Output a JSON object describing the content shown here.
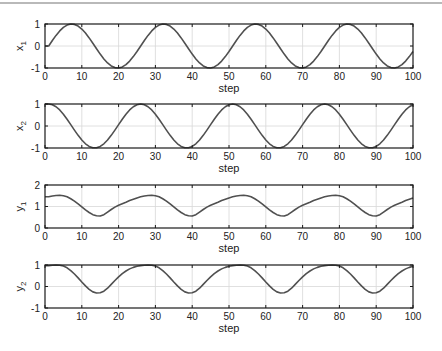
{
  "figure": {
    "width": 442,
    "height": 351,
    "line_color": "#505050",
    "grid_color": "#d8d8d8",
    "axes_color": "#1a1a1a"
  },
  "chart_data": [
    {
      "type": "line",
      "title": "",
      "xlabel": "step",
      "ylabel": "x_1",
      "ylabel_main": "x",
      "ylabel_sub": "1",
      "xlim": [
        0,
        100
      ],
      "ylim": [
        -1,
        1
      ],
      "xticks": [
        0,
        10,
        20,
        30,
        40,
        50,
        60,
        70,
        80,
        90,
        100
      ],
      "yticks": [
        -1,
        0,
        1
      ],
      "grid": true,
      "box": {
        "left": 45,
        "top": 24,
        "right": 413,
        "bottom": 68
      },
      "series": [
        {
          "name": "x1",
          "period_values": [
            0,
            0.249,
            0.482,
            0.685,
            0.844,
            0.951,
            0.998,
            0.982,
            0.905,
            0.771,
            0.588,
            0.368,
            0.125,
            -0.125,
            -0.368,
            -0.588,
            -0.771,
            -0.905,
            -0.982,
            -0.998,
            -0.951,
            -0.844,
            -0.685,
            -0.482,
            -0.249
          ]
        }
      ]
    },
    {
      "type": "line",
      "title": "",
      "xlabel": "step",
      "ylabel": "x_2",
      "ylabel_main": "x",
      "ylabel_sub": "2",
      "xlim": [
        0,
        100
      ],
      "ylim": [
        -1,
        1
      ],
      "xticks": [
        0,
        10,
        20,
        30,
        40,
        50,
        60,
        70,
        80,
        90,
        100
      ],
      "yticks": [
        -1,
        0,
        1
      ],
      "grid": true,
      "box": {
        "left": 45,
        "top": 104,
        "right": 413,
        "bottom": 148
      },
      "series": [
        {
          "name": "x2",
          "period_values": [
            1,
            0.969,
            0.876,
            0.729,
            0.536,
            0.309,
            0.063,
            -0.187,
            -0.426,
            -0.637,
            -0.809,
            -0.93,
            -0.992,
            -0.992,
            -0.93,
            -0.809,
            -0.637,
            -0.426,
            -0.187,
            0.063,
            0.309,
            0.536,
            0.729,
            0.876,
            0.969
          ]
        }
      ]
    },
    {
      "type": "line",
      "title": "",
      "xlabel": "step",
      "ylabel": "y_1",
      "ylabel_main": "y",
      "ylabel_sub": "1",
      "xlim": [
        0,
        100
      ],
      "ylim": [
        0,
        2
      ],
      "xticks": [
        0,
        10,
        20,
        30,
        40,
        50,
        60,
        70,
        80,
        90,
        100
      ],
      "yticks": [
        0,
        1,
        2
      ],
      "grid": true,
      "box": {
        "left": 45,
        "top": 185,
        "right": 413,
        "bottom": 228
      },
      "series": [
        {
          "name": "y1",
          "period_values": [
            1.45,
            1.49,
            1.51,
            1.52,
            1.5,
            1.45,
            1.36,
            1.25,
            1.12,
            0.98,
            0.84,
            0.72,
            0.62,
            0.57,
            0.56,
            0.62,
            0.74,
            0.86,
            0.97,
            1.06,
            1.13,
            1.2,
            1.28,
            1.34,
            1.4
          ]
        }
      ]
    },
    {
      "type": "line",
      "title": "",
      "xlabel": "step",
      "ylabel": "y_2",
      "ylabel_main": "y",
      "ylabel_sub": "2",
      "xlim": [
        0,
        100
      ],
      "ylim": [
        -1,
        1
      ],
      "xticks": [
        0,
        10,
        20,
        30,
        40,
        50,
        60,
        70,
        80,
        90,
        100
      ],
      "yticks": [
        -1,
        0,
        1
      ],
      "grid": true,
      "box": {
        "left": 45,
        "top": 265,
        "right": 413,
        "bottom": 308
      },
      "series": [
        {
          "name": "y2",
          "period_values": [
            0.97,
            0.99,
            1.0,
            0.99,
            0.95,
            0.87,
            0.74,
            0.58,
            0.4,
            0.21,
            0.03,
            -0.13,
            -0.25,
            -0.3,
            -0.29,
            -0.22,
            -0.08,
            0.1,
            0.28,
            0.45,
            0.6,
            0.72,
            0.82,
            0.89,
            0.94
          ]
        }
      ]
    }
  ],
  "series_note": {
    "sampling": "values at step t = period_values[(t-1) mod 25] for t = 1..100; step 0 equals step 1",
    "period_steps": 25,
    "x_start": 0,
    "x_end": 100
  }
}
